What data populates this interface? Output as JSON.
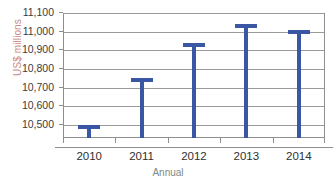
{
  "chart_data": {
    "type": "bar",
    "title": "",
    "subtitle": "",
    "xlabel": "Annual",
    "ylabel": "US$ millions",
    "categories": [
      "2010",
      "2011",
      "2012",
      "2013",
      "2014"
    ],
    "values": [
      10500,
      10750,
      10940,
      11040,
      11010
    ],
    "ylim": [
      10430,
      11100
    ],
    "yticks": [
      10500,
      10600,
      10700,
      10800,
      10900,
      11000,
      11100
    ],
    "ytick_labels": [
      "10,500",
      "10,600",
      "10,700",
      "10,800",
      "10,900",
      "11,000",
      "11,100"
    ],
    "grid": true,
    "legend": false,
    "legend_position": "none",
    "series": [
      {
        "name": "US$ millions",
        "values": [
          10500,
          10750,
          10940,
          11040,
          11010
        ]
      }
    ],
    "colors": {
      "bar": "#3a57a4",
      "gridline": "#9a9a9a",
      "axis": "#8e8e8e",
      "ylabel_text": "#c98a84",
      "xlabel_text": "#7c8b83",
      "tick_text": "#3b3b3b",
      "background": "#ffffff"
    },
    "bar_style": "t-bar-marker"
  }
}
